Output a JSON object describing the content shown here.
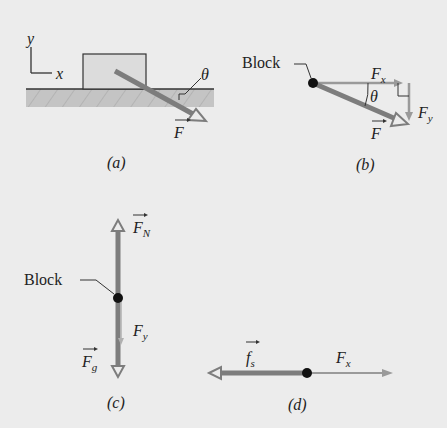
{
  "figure": {
    "panels": [
      {
        "id": "a",
        "caption": "(a)",
        "axes": {
          "y_label": "y",
          "x_label": "x"
        },
        "force_label": "F",
        "angle_label": "θ"
      },
      {
        "id": "b",
        "caption": "(b)",
        "block_label": "Block",
        "force_label": "F",
        "fx_label": "F",
        "fx_sub": "x",
        "fy_label": "F",
        "fy_sub": "y",
        "angle_label": "θ"
      },
      {
        "id": "c",
        "caption": "(c)",
        "block_label": "Block",
        "fn_label": "F",
        "fn_sub": "N",
        "fy_label": "F",
        "fy_sub": "y",
        "fg_label": "F",
        "fg_sub": "g"
      },
      {
        "id": "d",
        "caption": "(d)",
        "fs_label": "f",
        "fs_sub": "s",
        "fx_label": "F",
        "fx_sub": "x"
      }
    ],
    "colors": {
      "background": "#ececec",
      "arrow": "#7d7d7d",
      "arrow_light": "#9a9a9a",
      "block_fill": "#dcdcdc",
      "ground_fill": "#c4c4c4",
      "dot": "#111111",
      "text": "#222222"
    }
  }
}
